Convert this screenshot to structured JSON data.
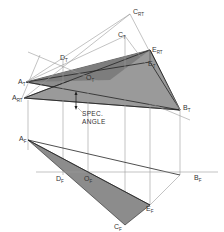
{
  "diagram": {
    "type": "descriptive-geometry-projection",
    "colors": {
      "shade": "#8c8c8c",
      "shade_light": "#a6a6a6",
      "line": "#222222",
      "construction": "#9a9a9a",
      "background": "#ffffff"
    },
    "top_view_labels": {
      "c_rt": {
        "main": "C",
        "sub": "RT"
      },
      "c_t": {
        "main": "C",
        "sub": "T"
      },
      "e_rt": {
        "main": "E",
        "sub": "RT"
      },
      "e_t": {
        "main": "E",
        "sub": "T"
      },
      "d_t": {
        "main": "D",
        "sub": "T"
      },
      "o_t": {
        "main": "O",
        "sub": "T"
      },
      "a_t": {
        "main": "A",
        "sub": "T"
      },
      "a_rt": {
        "main": "A",
        "sub": "RT"
      },
      "b_t": {
        "main": "B",
        "sub": "T"
      }
    },
    "front_view_labels": {
      "a_f": {
        "main": "A",
        "sub": "F"
      },
      "d_f": {
        "main": "D",
        "sub": "F"
      },
      "o_f": {
        "main": "O",
        "sub": "F"
      },
      "b_f": {
        "main": "B",
        "sub": "F"
      },
      "e_f": {
        "main": "E",
        "sub": "F"
      },
      "c_f": {
        "main": "C",
        "sub": "F"
      }
    },
    "annotation": {
      "line1": "SPEC.",
      "line2": "ANGLE"
    }
  }
}
